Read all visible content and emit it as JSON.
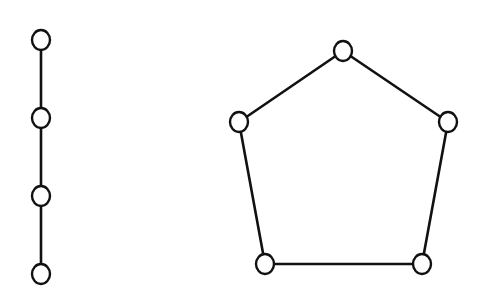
{
  "diagram": {
    "colors": {
      "background": "#ffffff",
      "stroke": "#111111",
      "node_fill": "#ffffff"
    },
    "graphs": [
      {
        "id": "path-graph",
        "type": "path",
        "node_count": 4,
        "nodes": [
          {
            "id": "p1",
            "cx": 41,
            "cy": 40
          },
          {
            "id": "p2",
            "cx": 41,
            "cy": 118
          },
          {
            "id": "p3",
            "cx": 41,
            "cy": 196
          },
          {
            "id": "p4",
            "cx": 41,
            "cy": 274
          }
        ],
        "edges": [
          [
            "p1",
            "p2"
          ],
          [
            "p2",
            "p3"
          ],
          [
            "p3",
            "p4"
          ]
        ]
      },
      {
        "id": "cycle-graph",
        "type": "cycle",
        "node_count": 5,
        "nodes": [
          {
            "id": "c1",
            "cx": 343,
            "cy": 51
          },
          {
            "id": "c2",
            "cx": 448,
            "cy": 122
          },
          {
            "id": "c3",
            "cx": 422,
            "cy": 264
          },
          {
            "id": "c4",
            "cx": 265,
            "cy": 264
          },
          {
            "id": "c5",
            "cx": 239,
            "cy": 122
          }
        ],
        "edges": [
          [
            "c1",
            "c2"
          ],
          [
            "c2",
            "c3"
          ],
          [
            "c3",
            "c4"
          ],
          [
            "c4",
            "c5"
          ],
          [
            "c5",
            "c1"
          ]
        ]
      }
    ],
    "node_rx": 9,
    "node_ry": 10
  }
}
